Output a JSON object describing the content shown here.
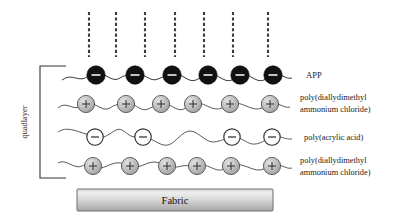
{
  "diagram": {
    "background": "#ffffff",
    "bracket_label": "quadlayer",
    "substrate": {
      "label": "Fabric",
      "color_top": "#e9e9e9",
      "color_bottom": "#a8a8a8",
      "border": "#6e6e6e"
    },
    "dashed_lines": {
      "count": 7,
      "color": "#3b3b3b",
      "x_positions": [
        89,
        116,
        145,
        175,
        204,
        233,
        268
      ],
      "y_top": 12,
      "y_bottom": 57
    },
    "layers": [
      {
        "id": "app",
        "label": "APP",
        "label_lines": [
          "APP"
        ],
        "charge": "−",
        "bead_fill": "#111111",
        "bead_stroke": "#000000",
        "sign_color": "#ffffff",
        "bead_count": 6,
        "bead_radius": 9.2,
        "y": 75,
        "x_positions": [
          96,
          135,
          172,
          208,
          240,
          273
        ]
      },
      {
        "id": "pdadmac-top",
        "label": "poly(diallydimethyl ammonium chloride)",
        "label_lines": [
          "poly(diallydimethyl",
          "ammonium  chloride)"
        ],
        "charge": "+",
        "bead_fill": "#b9b9b9",
        "bead_stroke": "#4d4d4d",
        "sign_color": "#3d3d3d",
        "bead_count": 6,
        "bead_radius": 8.6,
        "y": 104,
        "x_positions": [
          86,
          126,
          161,
          193,
          230,
          270
        ]
      },
      {
        "id": "paa",
        "label": "poly(acrylic acid)",
        "label_lines": [
          "poly(acrylic  acid)"
        ],
        "charge": "−",
        "bead_fill": "#ffffff",
        "bead_stroke": "#2e2e2e",
        "sign_color": "#2b2b2b",
        "bead_count": 4,
        "bead_radius": 8.2,
        "y": 137,
        "x_positions": [
          95,
          143,
          232,
          272
        ]
      },
      {
        "id": "pdadmac-bottom",
        "label": "poly(diallydimethyl ammonium chloride)",
        "label_lines": [
          "poly(diallydimethyl",
          "ammonium  chloride)"
        ],
        "charge": "+",
        "bead_fill": "#b9b9b9",
        "bead_stroke": "#4d4d4d",
        "sign_color": "#3d3d3d",
        "bead_count": 6,
        "bead_radius": 8.6,
        "y": 166,
        "x_positions": [
          93,
          130,
          167,
          197,
          231,
          272
        ]
      }
    ],
    "colors": {
      "anionic_dark": "#111111",
      "cationic_gray": "#b9b9b9",
      "anionic_open": "#ffffff",
      "chain": "#4a4a4a",
      "text": "#1c1c1c"
    }
  }
}
